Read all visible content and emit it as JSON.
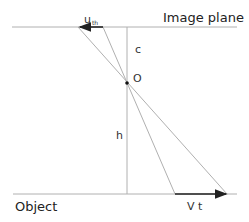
{
  "labels": {
    "image_plane": "Image plane",
    "object": "Object",
    "c": "c",
    "h": "h",
    "origin": "O",
    "u_main": "u",
    "u_sub": "th",
    "vt": "V t"
  },
  "geometry": {
    "image_plane_y": 27,
    "object_plane_y": 194,
    "axis_x": 127,
    "origin": [
      127,
      83
    ],
    "top_arrow": {
      "from": [
        103,
        27
      ],
      "to": [
        79,
        27
      ]
    },
    "bottom_arrow": {
      "from": [
        175,
        194
      ],
      "to": [
        227,
        194
      ]
    }
  },
  "colors": {
    "line": "#b0b0b0",
    "arrow": "#222222",
    "text": "#222222"
  }
}
